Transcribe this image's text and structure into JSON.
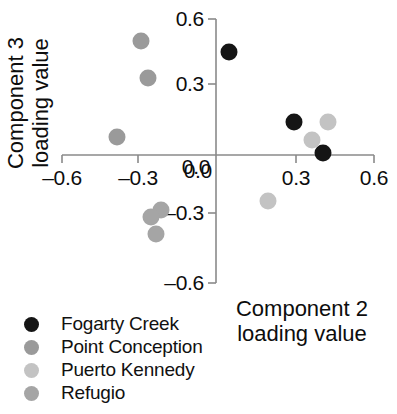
{
  "chart_data": {
    "type": "scatter",
    "title": "",
    "xlabel": "Component 2 loading value",
    "ylabel": "Component 3 loading value",
    "xlim": [
      -0.6,
      0.6
    ],
    "ylim": [
      -0.6,
      0.6
    ],
    "xticks": [
      "–0.6",
      "–0.3",
      "0.0",
      "0.3",
      "0.6"
    ],
    "xtick_values": [
      -0.6,
      -0.3,
      0.0,
      0.3,
      0.6
    ],
    "yticks": [
      "0.6",
      "0.3",
      "0.0",
      "–0.3",
      "–0.6"
    ],
    "ytick_values": [
      0.6,
      0.3,
      0.0,
      -0.3,
      -0.6
    ],
    "grid": false,
    "legend_position": "bottom-left",
    "axis_color": "#8a8a8a",
    "series": [
      {
        "name": "Fogarty Creek",
        "color": "#151515",
        "points": [
          {
            "x": 0.05,
            "y": 0.47
          },
          {
            "x": 0.3,
            "y": 0.15
          },
          {
            "x": 0.41,
            "y": 0.01
          }
        ]
      },
      {
        "name": "Point Conception",
        "color": "#9a9a9a",
        "points": [
          {
            "x": -0.29,
            "y": 0.52
          },
          {
            "x": -0.26,
            "y": 0.35
          },
          {
            "x": -0.38,
            "y": 0.08
          }
        ]
      },
      {
        "name": "Puerto Kennedy",
        "color": "#c3c3c3",
        "points": [
          {
            "x": 0.43,
            "y": 0.15
          },
          {
            "x": 0.37,
            "y": 0.07
          },
          {
            "x": 0.2,
            "y": -0.21
          }
        ]
      },
      {
        "name": "Refugio",
        "color": "#a5a5a5",
        "points": [
          {
            "x": -0.21,
            "y": -0.25
          },
          {
            "x": -0.25,
            "y": -0.28
          },
          {
            "x": -0.23,
            "y": -0.36
          }
        ]
      }
    ]
  }
}
